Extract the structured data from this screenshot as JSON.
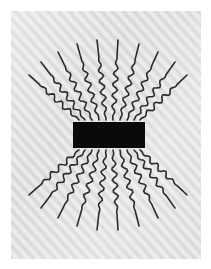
{
  "figure": {
    "canvas": {
      "width": 211,
      "height": 269
    },
    "background": {
      "page_color": "#ffffff",
      "panel_color": "#e0e0e0",
      "panel_stripe_color": "#d6d6d6",
      "panel_highlight_color": "#ececec",
      "stripe_angle_deg": 48,
      "panel": {
        "x": 11,
        "y": 11,
        "width": 190,
        "height": 248
      }
    },
    "emitter": {
      "name": "black-bar",
      "color": "#0a0a0a",
      "x": 73,
      "y": 122,
      "width": 72,
      "height": 26
    },
    "rays": {
      "name": "wavy-radiation-lines",
      "color": "#2b2b2b",
      "stroke_width": 1.6,
      "count": 20,
      "wave_amplitude": 2.6,
      "wave_period": 11,
      "upper_count": 10,
      "lower_count": 10,
      "upper": [
        {
          "x0": 79,
          "y0": 120,
          "x1": 29,
          "y1": 75,
          "len": 67
        },
        {
          "x0": 85,
          "y0": 120,
          "x1": 41,
          "y1": 62,
          "len": 73
        },
        {
          "x0": 92,
          "y0": 120,
          "x1": 58,
          "y1": 52,
          "len": 76
        },
        {
          "x0": 99,
          "y0": 120,
          "x1": 77,
          "y1": 44,
          "len": 79
        },
        {
          "x0": 106,
          "y0": 120,
          "x1": 97,
          "y1": 40,
          "len": 80
        },
        {
          "x0": 113,
          "y0": 120,
          "x1": 118,
          "y1": 40,
          "len": 80
        },
        {
          "x0": 120,
          "y0": 120,
          "x1": 139,
          "y1": 44,
          "len": 79
        },
        {
          "x0": 127,
          "y0": 120,
          "x1": 158,
          "y1": 52,
          "len": 76
        },
        {
          "x0": 134,
          "y0": 120,
          "x1": 175,
          "y1": 62,
          "len": 73
        },
        {
          "x0": 140,
          "y0": 120,
          "x1": 187,
          "y1": 75,
          "len": 67
        }
      ],
      "lower": [
        {
          "x0": 79,
          "y0": 150,
          "x1": 29,
          "y1": 195,
          "len": 67
        },
        {
          "x0": 85,
          "y0": 150,
          "x1": 41,
          "y1": 208,
          "len": 73
        },
        {
          "x0": 92,
          "y0": 150,
          "x1": 58,
          "y1": 218,
          "len": 76
        },
        {
          "x0": 99,
          "y0": 150,
          "x1": 77,
          "y1": 226,
          "len": 79
        },
        {
          "x0": 106,
          "y0": 150,
          "x1": 97,
          "y1": 230,
          "len": 80
        },
        {
          "x0": 113,
          "y0": 150,
          "x1": 118,
          "y1": 230,
          "len": 80
        },
        {
          "x0": 120,
          "y0": 150,
          "x1": 139,
          "y1": 226,
          "len": 79
        },
        {
          "x0": 127,
          "y0": 150,
          "x1": 158,
          "y1": 218,
          "len": 76
        },
        {
          "x0": 134,
          "y0": 150,
          "x1": 175,
          "y1": 208,
          "len": 73
        },
        {
          "x0": 140,
          "y0": 150,
          "x1": 187,
          "y1": 195,
          "len": 67
        }
      ]
    }
  }
}
